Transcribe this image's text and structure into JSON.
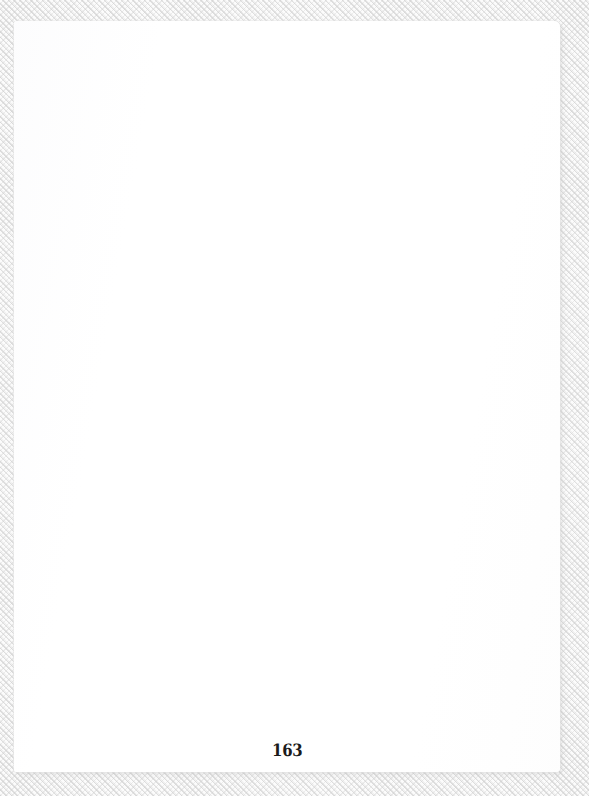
{
  "document": {
    "kind": "scanned-book-page",
    "page_content": "",
    "background_texture": "diagonal-hatch",
    "colors": {
      "paper": "#ffffff",
      "surround_texture": "#dcdcdc",
      "surround_base": "#fdfdfd",
      "folio_text": "#1b1b1b"
    }
  },
  "page": {
    "folio": {
      "number": "163",
      "position": "bottom-center"
    },
    "body": {
      "text": ""
    }
  }
}
